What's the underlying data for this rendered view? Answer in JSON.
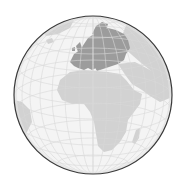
{
  "map": {
    "type": "orthographic-globe",
    "center_region": "Africa",
    "highlighted_region": "Europe",
    "colors": {
      "background": "#ffffff",
      "ocean": "#f4f4f4",
      "land": "#cfcfcf",
      "highlight": "#9a9a9a",
      "graticule": "#d8d8d8",
      "outline": "#3a3a3a"
    },
    "globe": {
      "cx": 93,
      "cy": 95,
      "r": 79
    },
    "regions": [
      "Europe",
      "Africa",
      "Middle East",
      "Asia",
      "South America",
      "Madagascar",
      "Greenland"
    ]
  }
}
